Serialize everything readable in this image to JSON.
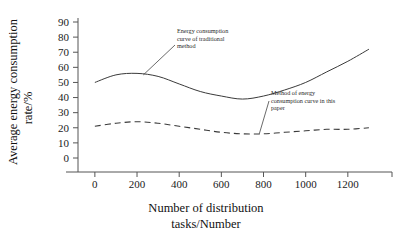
{
  "chart_data": {
    "type": "line",
    "title": "",
    "xlabel": "Number of distribution tasks/Number",
    "ylabel": "Average energy consumption rate/%",
    "xlim": [
      -80,
      1400
    ],
    "ylim": [
      0,
      90
    ],
    "grid": false,
    "legend_position": "inline-annotations",
    "xticks": [
      0,
      200,
      400,
      600,
      800,
      1000,
      1200
    ],
    "xtick_labels": [
      "0",
      "200",
      "400",
      "600",
      "800",
      "1000",
      "1200"
    ],
    "yticks": [
      0,
      10,
      20,
      30,
      40,
      50,
      60,
      70,
      80,
      90
    ],
    "ytick_labels": [
      "0",
      "10",
      "20",
      "30",
      "40",
      "50",
      "60",
      "70",
      "80",
      "90"
    ],
    "series": [
      {
        "name": "Energy consumption curve of traditional method",
        "style": "solid",
        "x": [
          0,
          100,
          200,
          300,
          400,
          500,
          600,
          700,
          800,
          900,
          1000,
          1100,
          1200,
          1300
        ],
        "values": [
          50,
          55,
          56,
          54,
          49,
          44,
          41,
          39,
          41,
          45,
          50,
          57,
          64,
          72
        ]
      },
      {
        "name": "Method of energy consumption curve in this paper",
        "style": "dashed",
        "x": [
          0,
          100,
          200,
          300,
          400,
          500,
          600,
          700,
          800,
          900,
          1000,
          1100,
          1200,
          1300
        ],
        "values": [
          21,
          23,
          24,
          23,
          21,
          19,
          17,
          16,
          16,
          17,
          18,
          19,
          19,
          20
        ]
      }
    ],
    "annotations": [
      {
        "id": "traditional",
        "lines": [
          "Energy consumption",
          "curve of traditional",
          "method"
        ],
        "target_x": 230,
        "target_y": 55
      },
      {
        "id": "this-paper",
        "lines": [
          "Method of energy",
          "consumption curve in this",
          "paper"
        ],
        "target_x": 780,
        "target_y": 16
      }
    ],
    "colors": {
      "axis": "#555555",
      "solid_series": "#3a3a3a",
      "dashed_series": "#3a3a3a",
      "text": "#1a1a1a",
      "background": "#ffffff"
    }
  }
}
